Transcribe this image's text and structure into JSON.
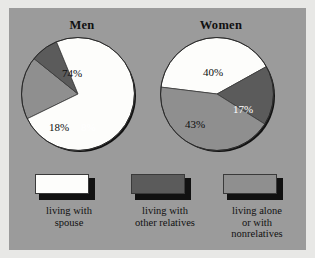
{
  "figure": {
    "background_color": "#9b9b9b",
    "page_background_color": "#e8e8e6"
  },
  "chart_data": {
    "type": "pie",
    "title": "",
    "categories": [
      "living with spouse",
      "living with other relatives",
      "living alone or with nonrelatives"
    ],
    "colors": [
      "#fdfdfb",
      "#5b5b5b",
      "#8f8f8f"
    ],
    "charts": [
      {
        "title": "Men",
        "labels": [
          "74%",
          "8%",
          "18%"
        ],
        "values": [
          74,
          8,
          18
        ],
        "slices": [
          {
            "category": "living with spouse",
            "label": "74%",
            "value": 74,
            "color": "#fdfdfb",
            "label_color": "dark"
          },
          {
            "category": "living with other relatives",
            "label": "8%",
            "value": 8,
            "color": "#5b5b5b",
            "label_color": "light"
          },
          {
            "category": "living alone or with nonrelatives",
            "label": "18%",
            "value": 18,
            "color": "#8f8f8f",
            "label_color": "dark"
          }
        ]
      },
      {
        "title": "Women",
        "labels": [
          "40%",
          "17%",
          "43%"
        ],
        "values": [
          40,
          17,
          43
        ],
        "slices": [
          {
            "category": "living with spouse",
            "label": "40%",
            "value": 40,
            "color": "#fdfdfb",
            "label_color": "dark"
          },
          {
            "category": "living with other relatives",
            "label": "17%",
            "value": 17,
            "color": "#5b5b5b",
            "label_color": "light"
          },
          {
            "category": "living alone or with nonrelatives",
            "label": "43%",
            "value": 43,
            "color": "#8f8f8f",
            "label_color": "dark"
          }
        ]
      }
    ],
    "legend": [
      {
        "swatch_color": "#fdfdfb",
        "lines": [
          "living with",
          "spouse"
        ]
      },
      {
        "swatch_color": "#5b5b5b",
        "lines": [
          "living with",
          "other relatives"
        ]
      },
      {
        "swatch_color": "#8f8f8f",
        "lines": [
          "living alone",
          "or with",
          "nonrelatives"
        ]
      }
    ],
    "legend_position": "bottom"
  }
}
